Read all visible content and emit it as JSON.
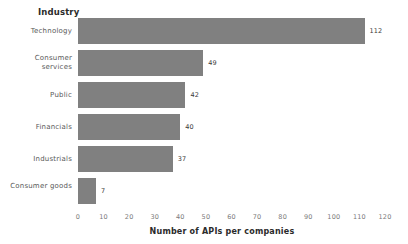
{
  "chart_data": {
    "type": "bar",
    "orientation": "horizontal",
    "title": "Industry",
    "subtitle": "",
    "categories": [
      "Technology",
      "Consumer services",
      "Public",
      "Financials",
      "Industrials",
      "Consumer goods"
    ],
    "values": [
      112,
      49,
      42,
      40,
      37,
      7
    ],
    "value_labels": [
      "112",
      "49",
      "42",
      "40",
      "37",
      "7"
    ],
    "xlabel": "Number of APIs per companies",
    "ylabel": "Industry",
    "xlim": [
      0,
      120
    ],
    "xticks": [
      0,
      10,
      20,
      30,
      40,
      50,
      60,
      70,
      80,
      90,
      100,
      110,
      120
    ],
    "xtick_labels": [
      "0",
      "10",
      "20",
      "30",
      "40",
      "50",
      "60",
      "70",
      "80",
      "90",
      "100",
      "110",
      "120"
    ],
    "grid": false,
    "legend": false,
    "bar_color": "#808080",
    "background_color": "#ffffff",
    "label_color": "#595959",
    "tick_color": "#7a7a7a"
  }
}
